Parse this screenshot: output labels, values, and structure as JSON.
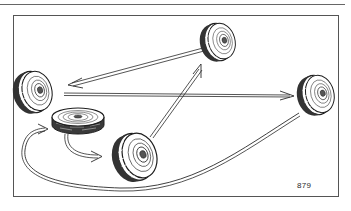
{
  "diagram": {
    "type": "tire-rotation-illustration",
    "figure_number": "879",
    "colors": {
      "ink": "#1e1e1e",
      "frame": "#555555",
      "paper": "#ffffff"
    },
    "wheels": [
      {
        "id": "top-right-wheel",
        "position": "top-center",
        "cx": 218,
        "cy": 42
      },
      {
        "id": "left-wheel",
        "position": "left",
        "cx": 33,
        "cy": 92
      },
      {
        "id": "right-wheel",
        "position": "right",
        "cx": 316,
        "cy": 95
      },
      {
        "id": "spare-wheel",
        "position": "center-left (lying flat)",
        "cx": 78,
        "cy": 117
      },
      {
        "id": "bottom-wheel",
        "position": "bottom-center",
        "cx": 135,
        "cy": 157
      }
    ],
    "arrows": [
      {
        "from": "top-right-wheel",
        "to": "left-wheel"
      },
      {
        "from": "left-wheel",
        "to": "right-wheel"
      },
      {
        "from": "bottom-wheel",
        "to": "top-right-wheel"
      },
      {
        "from": "right-wheel",
        "to": "spare-wheel",
        "route": "curved along bottom"
      },
      {
        "from": "spare-wheel",
        "to": "bottom-wheel",
        "route": "curved"
      }
    ]
  }
}
